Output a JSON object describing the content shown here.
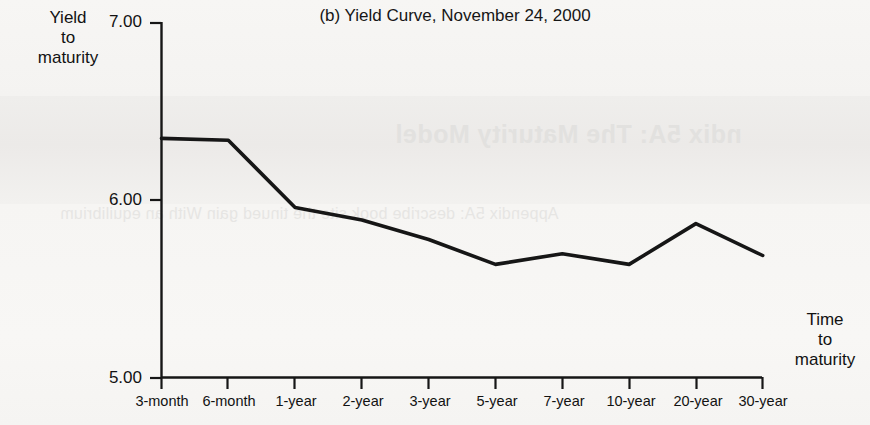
{
  "chart_data": {
    "type": "line",
    "title": "(b) Yield Curve, November 24, 2000",
    "ylabel": "Yield to maturity",
    "xlabel": "Time to maturity",
    "categories": [
      "3-month",
      "6-month",
      "1-year",
      "2-year",
      "3-year",
      "5-year",
      "7-year",
      "10-year",
      "20-year",
      "30-year"
    ],
    "values": [
      6.35,
      6.34,
      5.96,
      5.89,
      5.78,
      5.64,
      5.7,
      5.64,
      5.87,
      5.69
    ],
    "ylim": [
      5.0,
      7.0
    ],
    "ytick_labels": [
      "7.00",
      "6.00",
      "5.00"
    ],
    "ytick_values": [
      7.0,
      6.0,
      5.0
    ],
    "grid": false,
    "legend": null,
    "series_color": "#161616"
  },
  "chart": {
    "title": "(b) Yield Curve, November 24, 2000",
    "y_axis_title_lines": [
      "Yield",
      "to",
      "maturity"
    ],
    "x_axis_title_lines": [
      "Time",
      "to",
      "maturity"
    ],
    "y_ticks": [
      {
        "label": "7.00",
        "value": 7.0
      },
      {
        "label": "6.00",
        "value": 6.0
      },
      {
        "label": "5.00",
        "value": 5.0
      }
    ],
    "x_ticks": [
      {
        "label": "3-month"
      },
      {
        "label": "6-month"
      },
      {
        "label": "1-year"
      },
      {
        "label": "2-year"
      },
      {
        "label": "3-year"
      },
      {
        "label": "5-year"
      },
      {
        "label": "7-year"
      },
      {
        "label": "10-year"
      },
      {
        "label": "20-year"
      },
      {
        "label": "30-year"
      }
    ]
  },
  "background": {
    "bleed_title": "ndix 5A: The Maturity Model",
    "bleed_body": "Appendix 5A: describe  book  site  the  tinued  gain     With an equilibrium"
  },
  "colors": {
    "paper": "#f6f5f3",
    "ink": "#161616",
    "bleed": "#e2e1df"
  }
}
